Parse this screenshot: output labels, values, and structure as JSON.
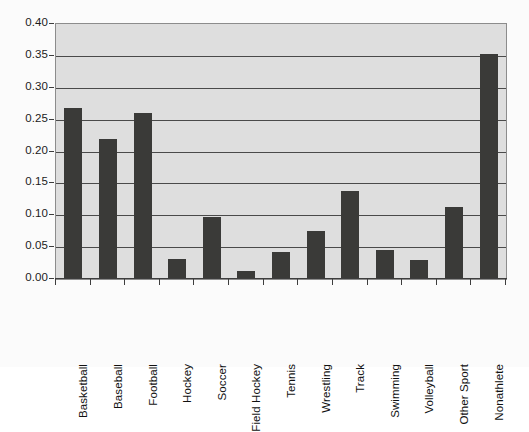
{
  "chart_data": {
    "type": "bar",
    "title": "",
    "subtitle": "",
    "xlabel": "",
    "ylabel": "",
    "ylim": [
      0,
      0.4
    ],
    "ytick_labels": [
      "0.00",
      "0.05",
      "0.10",
      "0.15",
      "0.20",
      "0.25",
      "0.30",
      "0.35",
      "0.40"
    ],
    "ytick_values": [
      0.0,
      0.05,
      0.1,
      0.15,
      0.2,
      0.25,
      0.3,
      0.35,
      0.4
    ],
    "grid": true,
    "legend": false,
    "legend_position": "none",
    "categories": [
      "Basketball",
      "Baseball",
      "Football",
      "Hockey",
      "Soccer",
      "Field Hockey",
      "Tennis",
      "Wrestling",
      "Track",
      "Swimming",
      "Volleyball",
      "Other Sport",
      "Nonathlete"
    ],
    "values": [
      0.268,
      0.22,
      0.26,
      0.032,
      0.097,
      0.013,
      0.042,
      0.076,
      0.138,
      0.045,
      0.03,
      0.113,
      0.353
    ],
    "colors": {
      "bar_fill": "#3a3a38",
      "plot_background": "#dedede",
      "gridline": "#4a4a4a",
      "axis": "#3d3d3d",
      "figure_background": "#fbfbfb",
      "text": "#111111"
    }
  }
}
